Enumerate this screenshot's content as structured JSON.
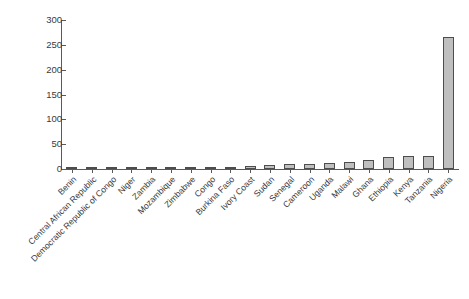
{
  "chart_data": {
    "type": "bar",
    "title": "",
    "subtitle": "",
    "xlabel": "",
    "ylabel": "",
    "ylim": [
      0,
      300
    ],
    "yticks": [
      0,
      50,
      100,
      150,
      200,
      250,
      300
    ],
    "grid": false,
    "legend": null,
    "bar_color": "#bfbfbf",
    "bar_edge_color": "#4d4d4d",
    "axis_color": "#5a5a5a",
    "text_color": "#3a3a3a",
    "background": "#ffffff",
    "categories": [
      "Benin",
      "Central African Republic",
      "Democratic Republic of Congo",
      "Niger",
      "Zambia",
      "Mozambique",
      "Zimbabwe",
      "Congo",
      "Burkina Faso",
      "Ivory Coast",
      "Sudan",
      "Senegal",
      "Cameroon",
      "Uganda",
      "Malawi",
      "Ghana",
      "Ethiopia",
      "Kenya",
      "Tanzania",
      "Nigeria"
    ],
    "values": [
      1,
      1,
      1,
      1,
      1,
      1,
      1,
      2,
      5,
      7,
      9,
      10,
      11,
      12,
      14,
      19,
      25,
      27,
      27,
      265
    ]
  }
}
